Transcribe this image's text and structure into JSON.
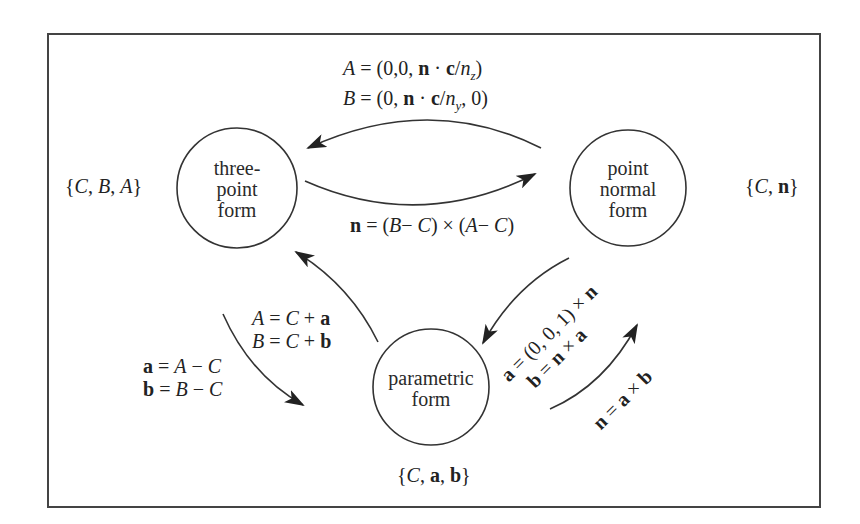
{
  "diagram": {
    "nodes": [
      {
        "id": "three_point",
        "label_lines": [
          "three-",
          "point",
          "form"
        ],
        "set": "{C, B, A}"
      },
      {
        "id": "point_normal",
        "label_lines": [
          "point",
          "normal",
          "form"
        ],
        "set": "{C, n}"
      },
      {
        "id": "parametric",
        "label_lines": [
          "parametric",
          "form"
        ],
        "set": "{C, a, b}"
      }
    ],
    "edges": [
      {
        "from": "point_normal",
        "to": "three_point",
        "label_lines": [
          "A = (0,0, n · c/n_z)",
          "B = (0, n · c/n_y, 0)"
        ]
      },
      {
        "from": "three_point",
        "to": "point_normal",
        "label_lines": [
          "n = (B− C) × (A− C)"
        ]
      },
      {
        "from": "three_point",
        "to": "parametric",
        "label_lines": [
          "a = A − C",
          "b = B − C"
        ]
      },
      {
        "from": "parametric",
        "to": "three_point",
        "label_lines": [
          "A = C + a",
          "B = C + b"
        ]
      },
      {
        "from": "point_normal",
        "to": "parametric",
        "label_lines": [
          "a = (0, 0, 1) × n",
          "b = n × a"
        ]
      },
      {
        "from": "parametric",
        "to": "point_normal",
        "label_lines": [
          "n = a × b"
        ]
      }
    ]
  },
  "colors": {
    "stroke": "#333333",
    "background": "#ffffff",
    "text": "#222222"
  }
}
